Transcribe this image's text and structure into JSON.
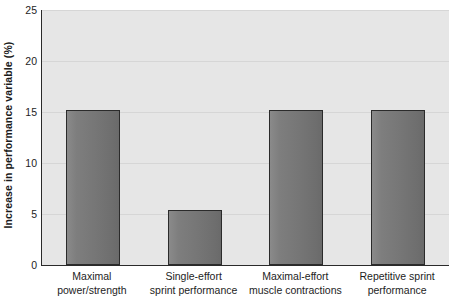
{
  "chart_data": {
    "type": "bar",
    "title": "",
    "xlabel": "",
    "ylabel": "Increase in performance variable (%)",
    "ylim": [
      0,
      25
    ],
    "yticks": [
      0,
      5,
      10,
      15,
      20,
      25
    ],
    "ytick_labels": [
      "0",
      "5",
      "10",
      "15",
      "20",
      "25"
    ],
    "grid": true,
    "legend": null,
    "categories": [
      "Maximal power/strength",
      "Single-effort sprint performance",
      "Maximal-effort muscle contractions",
      "Repetitive sprint performance"
    ],
    "category_lines": [
      [
        "Maximal",
        "power/strength"
      ],
      [
        "Single-effort",
        "sprint performance"
      ],
      [
        "Maximal-effort",
        "muscle contractions"
      ],
      [
        "Repetitive sprint",
        "performance"
      ]
    ],
    "values": [
      15.2,
      5.4,
      15.2,
      15.2
    ],
    "bar_color": "#787878",
    "bar_edge_color": "#2b2b2b",
    "plot_background": "#e6e6e6",
    "gridline_color": "#d6d6d6",
    "axis_color": "#2a2a2a"
  }
}
